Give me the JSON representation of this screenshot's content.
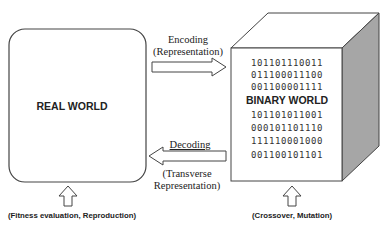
{
  "real_world": {
    "label": "REAL WORLD"
  },
  "binary_world": {
    "label": "BINARY WORLD",
    "bits_top": [
      "101101110011",
      "011100011100",
      "001100001111"
    ],
    "bits_bottom": [
      "101101011001",
      "000101101110",
      "111110001000",
      "001100101101"
    ]
  },
  "encoding": {
    "line1": "Encoding",
    "line2": "(Representation)"
  },
  "decoding": {
    "line1": "Decoding",
    "line2": "(Transverse",
    "line3": "Representation)"
  },
  "captions": {
    "left": "(Fitness evaluation, Reproduction)",
    "right": "(Crossover, Mutation)"
  },
  "colors": {
    "stroke": "#333333",
    "side_face": "#a6a6a6",
    "face": "#ffffff"
  }
}
